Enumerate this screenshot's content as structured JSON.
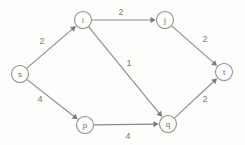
{
  "diagram": {
    "background_color": "#fdfdfb",
    "line_color": "#8a8a8a",
    "text_color": "#6e6e6e",
    "nodes": [
      {
        "id": "s",
        "label": "s",
        "x": 20,
        "y": 74,
        "r": 8.5
      },
      {
        "id": "i",
        "label": "i",
        "x": 83,
        "y": 20,
        "r": 8.5
      },
      {
        "id": "j",
        "label": "j",
        "x": 165,
        "y": 20,
        "r": 8.5
      },
      {
        "id": "t",
        "label": "t",
        "x": 224,
        "y": 72,
        "r": 8.5
      },
      {
        "id": "p",
        "label": "p",
        "x": 85,
        "y": 125,
        "r": 8.5
      },
      {
        "id": "q",
        "label": "q",
        "x": 168,
        "y": 124,
        "r": 8.5
      }
    ],
    "edges": [
      {
        "from": "s",
        "to": "i",
        "weight": "2",
        "wx": 42,
        "wy": 41
      },
      {
        "from": "s",
        "to": "p",
        "weight": "4",
        "wx": 40,
        "wy": 99
      },
      {
        "from": "i",
        "to": "j",
        "weight": "2",
        "wx": 121,
        "wy": 12
      },
      {
        "from": "i",
        "to": "q",
        "weight": "1",
        "wx": 129,
        "wy": 63
      },
      {
        "from": "j",
        "to": "t",
        "weight": "2",
        "wx": 205,
        "wy": 39
      },
      {
        "from": "p",
        "to": "q",
        "weight": "4",
        "wx": 128,
        "wy": 136
      },
      {
        "from": "q",
        "to": "t",
        "weight": "2",
        "wx": 205,
        "wy": 99
      }
    ]
  }
}
